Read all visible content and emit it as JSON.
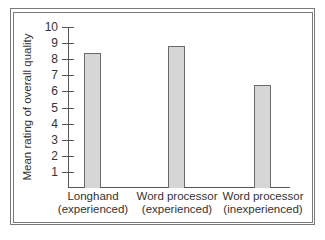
{
  "chart_data": {
    "type": "bar",
    "title": "",
    "xlabel": "",
    "ylabel": "Mean rating of overall quality",
    "ylim": [
      0,
      10
    ],
    "yticks": [
      1,
      2,
      3,
      4,
      5,
      6,
      7,
      8,
      9,
      10
    ],
    "grid": false,
    "legend": null,
    "categories": [
      {
        "line1": "Longhand",
        "line2": "(experienced)"
      },
      {
        "line1": "Word processor",
        "line2": "(experienced)"
      },
      {
        "line1": "Word processor",
        "line2": "(inexperienced)"
      }
    ],
    "values": [
      8.4,
      8.8,
      6.4
    ],
    "colors": {
      "bar_fill": "#d6d6d6",
      "bar_edge": "#6a6a6a",
      "axis": "#555555"
    }
  }
}
